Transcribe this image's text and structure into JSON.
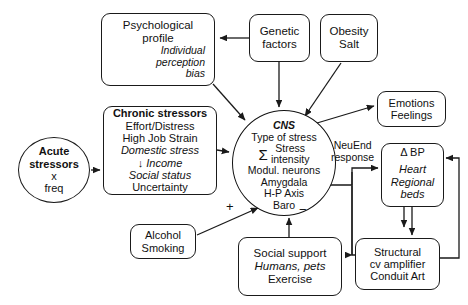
{
  "diagram": {
    "background": "#ffffff",
    "stroke": "#1a1a1a",
    "nodes": {
      "psych_profile": {
        "line1": "Psychological",
        "line2": "profile",
        "line3": "Individual",
        "line4": "perception",
        "line5": "bias"
      },
      "genetic": {
        "line1": "Genetic",
        "line2": "factors"
      },
      "obesity": {
        "line1": "Obesity",
        "line2": "Salt"
      },
      "chronic": {
        "title": "Chronic stressors",
        "line1": "Effort/Distress",
        "line2": "High Job Strain",
        "line3": "Domestic stress",
        "line4": "↓ Income",
        "line5": "Social status",
        "line6": "Uncertainty"
      },
      "acute": {
        "line1": "Acute",
        "line2": "stressors",
        "line3": "x",
        "line4": "freq"
      },
      "cns": {
        "title": "CNS",
        "line1": "Type of stress",
        "sigma": "Σ",
        "line2": "Stress",
        "line3": "intensity",
        "line4": "Modul. neurons",
        "line5": "Amygdala",
        "line6": "H-P Axis",
        "line7": "Baro"
      },
      "alcohol": {
        "line1": "Alcohol",
        "line2": "Smoking"
      },
      "social": {
        "line1": "Social support",
        "line2": "Humans, pets",
        "line3": "Exercise"
      },
      "emotions": {
        "line1": "Emotions",
        "line2": "Feelings"
      },
      "dbp": {
        "line1": "Δ BP",
        "line2": "Heart",
        "line3": "Regional",
        "line4": "beds"
      },
      "structural": {
        "line1": "Structural",
        "line2": "cv amplifier",
        "line3": "Conduit Art"
      }
    },
    "edge_labels": {
      "neuend_line1": "NeuEnd",
      "neuend_line2": "response",
      "plus": "+",
      "minus": "−"
    }
  }
}
